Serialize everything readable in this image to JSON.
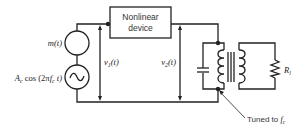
{
  "diagram": {
    "type": "circuit",
    "components": {
      "message_source": {
        "label": "m(t)"
      },
      "carrier_source": {
        "label": "A_c cos (2πf_c t)",
        "label_parts": {
          "amp": "A",
          "amp_sub": "c",
          "mid": " cos (2π",
          "f": "f",
          "f_sub": "c",
          "end": " t)"
        }
      },
      "nonlinear_device": {
        "line1": "Nonlinear",
        "line2": "device"
      },
      "input_voltage": {
        "label": "v",
        "sub": "1",
        "arg": "(t)"
      },
      "output_voltage": {
        "label": "v",
        "sub": "2",
        "arg": "(t)"
      },
      "load_resistor": {
        "label": "R",
        "sub": "l"
      },
      "tank_annotation": {
        "text": "Tuned to ",
        "f": "f",
        "f_sub": "c"
      }
    }
  }
}
